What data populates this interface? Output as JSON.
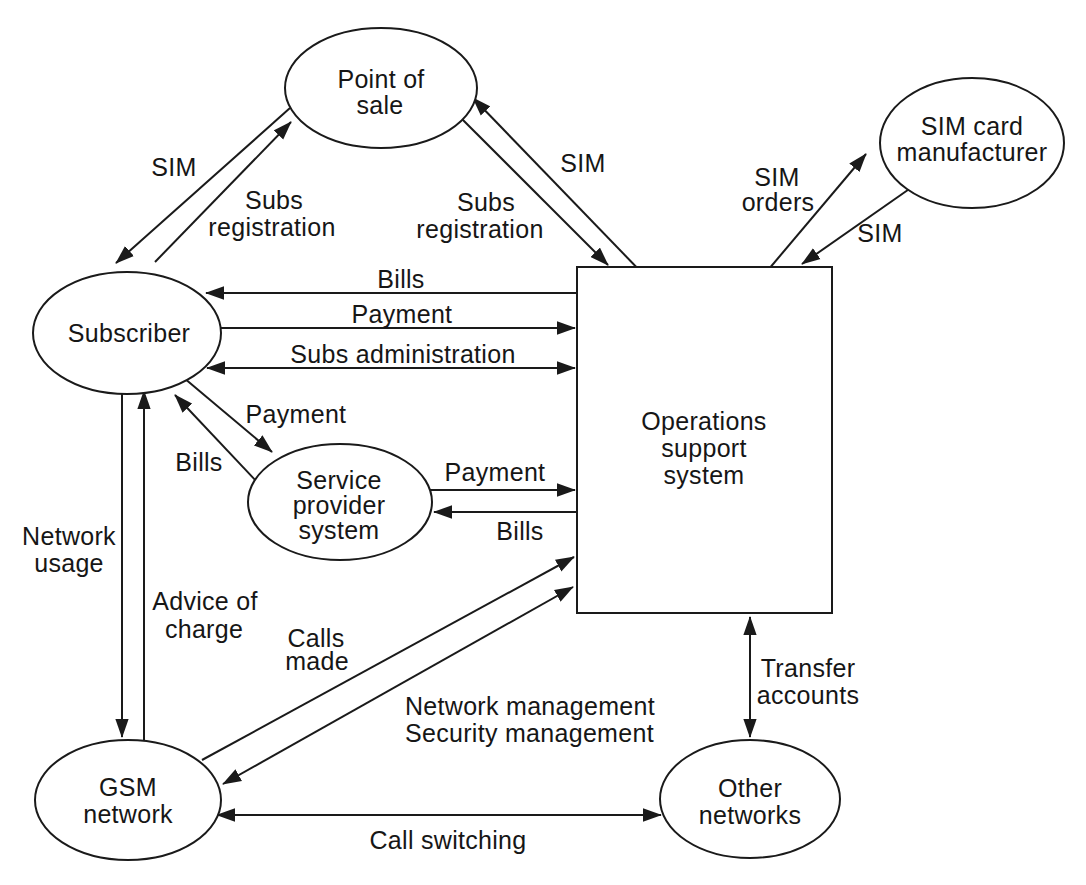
{
  "window": {
    "width_px": 1086,
    "height_px": 885,
    "background": "#ffffff",
    "ink_color": "#1a1a1a"
  },
  "diagram": {
    "type": "entity-flow-diagram",
    "nodes": [
      {
        "id": "point-of-sale",
        "shape": "ellipse",
        "lines": [
          "Point of",
          "sale"
        ]
      },
      {
        "id": "sim-card-manufacturer",
        "shape": "ellipse",
        "lines": [
          "SIM card",
          "manufacturer"
        ]
      },
      {
        "id": "subscriber",
        "shape": "ellipse",
        "lines": [
          "Subscriber"
        ]
      },
      {
        "id": "operations-support-system",
        "shape": "rectangle",
        "lines": [
          "Operations",
          "support",
          "system"
        ]
      },
      {
        "id": "service-provider-system",
        "shape": "ellipse",
        "lines": [
          "Service",
          "provider",
          "system"
        ]
      },
      {
        "id": "gsm-network",
        "shape": "ellipse",
        "lines": [
          "GSM",
          "network"
        ]
      },
      {
        "id": "other-networks",
        "shape": "ellipse",
        "lines": [
          "Other",
          "networks"
        ]
      }
    ],
    "edges": [
      {
        "from": "point-of-sale",
        "to": "subscriber",
        "direction": "one-way",
        "label_lines": [
          "SIM"
        ]
      },
      {
        "from": "subscriber",
        "to": "point-of-sale",
        "direction": "one-way",
        "label_lines": [
          "Subs",
          "registration"
        ]
      },
      {
        "from": "operations-support-system",
        "to": "point-of-sale",
        "direction": "one-way",
        "label_lines": [
          "SIM"
        ]
      },
      {
        "from": "point-of-sale",
        "to": "operations-support-system",
        "direction": "one-way",
        "label_lines": [
          "Subs",
          "registration"
        ]
      },
      {
        "from": "operations-support-system",
        "to": "sim-card-manufacturer",
        "direction": "one-way",
        "label_lines": [
          "SIM",
          "orders"
        ]
      },
      {
        "from": "sim-card-manufacturer",
        "to": "operations-support-system",
        "direction": "one-way",
        "label_lines": [
          "SIM"
        ]
      },
      {
        "from": "operations-support-system",
        "to": "subscriber",
        "direction": "one-way",
        "label_lines": [
          "Bills"
        ]
      },
      {
        "from": "subscriber",
        "to": "operations-support-system",
        "direction": "one-way",
        "label_lines": [
          "Payment"
        ]
      },
      {
        "from": "subscriber",
        "to": "operations-support-system",
        "direction": "two-way",
        "label_lines": [
          "Subs administration"
        ]
      },
      {
        "from": "subscriber",
        "to": "service-provider-system",
        "direction": "one-way",
        "label_lines": [
          "Payment"
        ]
      },
      {
        "from": "service-provider-system",
        "to": "subscriber",
        "direction": "one-way",
        "label_lines": [
          "Bills"
        ]
      },
      {
        "from": "service-provider-system",
        "to": "operations-support-system",
        "direction": "one-way",
        "label_lines": [
          "Payment"
        ]
      },
      {
        "from": "operations-support-system",
        "to": "service-provider-system",
        "direction": "one-way",
        "label_lines": [
          "Bills"
        ]
      },
      {
        "from": "subscriber",
        "to": "gsm-network",
        "direction": "one-way",
        "label_lines": [
          "Network",
          "usage"
        ]
      },
      {
        "from": "gsm-network",
        "to": "subscriber",
        "direction": "one-way",
        "label_lines": [
          "Advice of",
          "charge"
        ]
      },
      {
        "from": "gsm-network",
        "to": "operations-support-system",
        "direction": "one-way",
        "label_lines": [
          "Calls",
          "made"
        ]
      },
      {
        "from": "operations-support-system",
        "to": "gsm-network",
        "direction": "two-way",
        "label_lines": [
          "Network management",
          "Security management"
        ]
      },
      {
        "from": "operations-support-system",
        "to": "other-networks",
        "direction": "two-way",
        "label_lines": [
          "Transfer",
          "accounts"
        ]
      },
      {
        "from": "gsm-network",
        "to": "other-networks",
        "direction": "two-way",
        "label_lines": [
          "Call switching"
        ]
      }
    ]
  }
}
